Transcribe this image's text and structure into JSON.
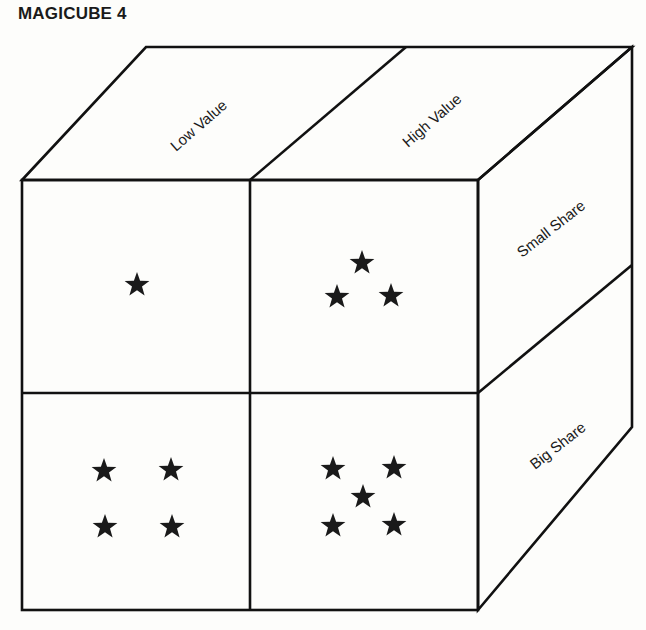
{
  "title": "MAGICUBE 4",
  "cube": {
    "top_labels": [
      "Low Value",
      "High Value"
    ],
    "side_labels": [
      "Small Share",
      "Big Share"
    ],
    "cells": [
      {
        "row": "Small Share",
        "column": "Low Value",
        "stars": 1
      },
      {
        "row": "Small Share",
        "column": "High Value",
        "stars": 3
      },
      {
        "row": "Big Share",
        "column": "Low Value",
        "stars": 4
      },
      {
        "row": "Big Share",
        "column": "High Value",
        "stars": 5
      }
    ]
  },
  "colors": {
    "line": "#111111",
    "star": "#1a1a1a",
    "background": "#fdfdfb"
  }
}
